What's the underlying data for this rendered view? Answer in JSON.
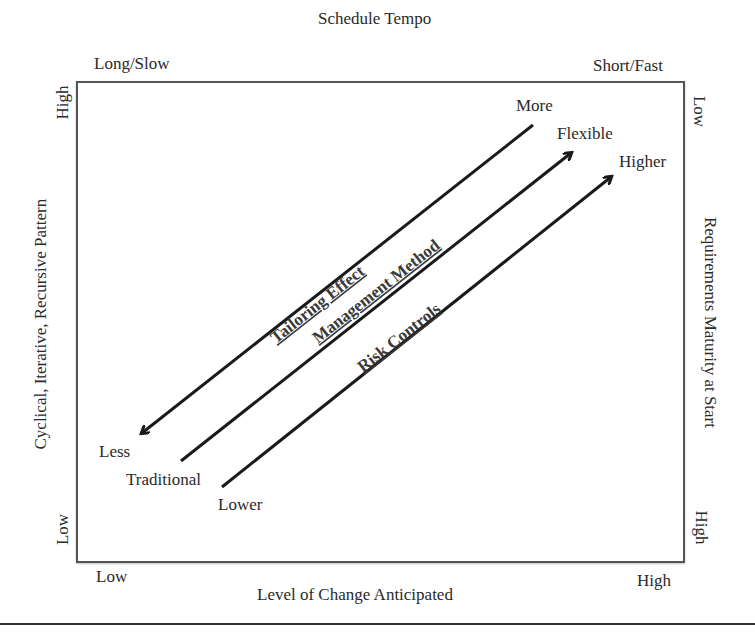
{
  "diagram": {
    "top_axis": {
      "title": "Schedule Tempo",
      "left_label": "Long/Slow",
      "right_label": "Short/Fast"
    },
    "bottom_axis": {
      "title": "Level of Change Anticipated",
      "left_label": "Low",
      "right_label": "High"
    },
    "left_axis": {
      "title": "Cyclical, Iterative, Recursive Pattern",
      "top_label": "High",
      "bottom_label": "Low"
    },
    "right_axis": {
      "title": "Requirements Maturity at Start",
      "top_label": "Low",
      "bottom_label": "High"
    },
    "arrows": [
      {
        "label": "Tailoring Effect",
        "start_label": "More",
        "end_label": "Less",
        "direction": "toward lower-left"
      },
      {
        "label": "Management Method",
        "start_label": "Traditional",
        "end_label": "Flexible",
        "direction": "toward upper-right"
      },
      {
        "label": "Risk Controls",
        "start_label": "Lower",
        "end_label": "Higher",
        "direction": "toward upper-right"
      }
    ],
    "colors": {
      "line": "#1a1a1a",
      "text": "#2a2a2a",
      "frame": "#555555"
    }
  }
}
